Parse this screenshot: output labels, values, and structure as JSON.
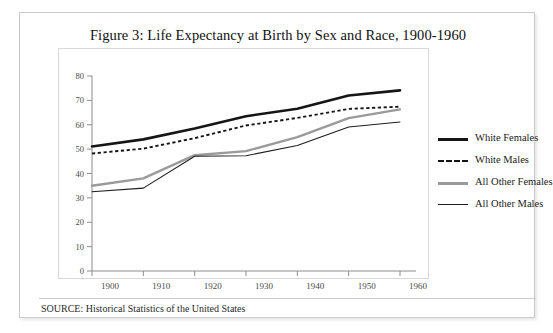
{
  "figure": {
    "title": "Figure 3: Life Expectancy at Birth by Sex and Race, 1900-1960",
    "source_note": "SOURCE: Historical Statistics of the United States"
  },
  "legend": {
    "items": [
      {
        "label": "White Females",
        "color": "#151515",
        "style": "solid-thick"
      },
      {
        "label": "White Males",
        "color": "#151515",
        "style": "dashed"
      },
      {
        "label": "All Other Females",
        "color": "#9a9a9a",
        "style": "solid-medium"
      },
      {
        "label": "All Other Males",
        "color": "#1e1e1e",
        "style": "solid-thin"
      }
    ]
  },
  "axes": {
    "y_ticks": [
      "0",
      "10",
      "20",
      "30",
      "40",
      "50",
      "60",
      "70",
      "80"
    ],
    "x_ticks": [
      "1900",
      "1910",
      "1920",
      "1930",
      "1940",
      "1950",
      "1960"
    ]
  },
  "chart_data": {
    "type": "line",
    "title": "Figure 3: Life Expectancy at Birth by Sex and Race, 1900-1960",
    "xlabel": "",
    "ylabel": "",
    "x": [
      1900,
      1910,
      1920,
      1930,
      1940,
      1950,
      1960
    ],
    "xlim": [
      1900,
      1960
    ],
    "ylim": [
      0,
      80
    ],
    "grid": false,
    "legend_position": "right",
    "series": [
      {
        "name": "White Females",
        "color": "#151515",
        "values": [
          51.1,
          54.0,
          58.5,
          63.5,
          66.6,
          72.0,
          74.1
        ]
      },
      {
        "name": "White Males",
        "color": "#151515",
        "values": [
          48.2,
          50.2,
          54.5,
          59.7,
          62.8,
          66.5,
          67.4
        ]
      },
      {
        "name": "All Other Females",
        "color": "#9a9a9a",
        "values": [
          35.0,
          38.0,
          47.5,
          49.2,
          54.9,
          62.7,
          66.3
        ]
      },
      {
        "name": "All Other Males",
        "color": "#1e1e1e",
        "values": [
          32.5,
          34.0,
          47.1,
          47.3,
          51.5,
          59.1,
          61.1
        ]
      }
    ]
  }
}
